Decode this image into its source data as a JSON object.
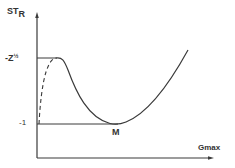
{
  "diagram": {
    "y_axis": {
      "label_main": "ST",
      "label_sub": "R"
    },
    "x_axis": {
      "label": "Gmax"
    },
    "ticks": {
      "upper": {
        "base": "-Z",
        "exp": "½"
      },
      "lower": "-1"
    },
    "point_label": "M",
    "colors": {
      "line": "#3a3a3a",
      "background": "#ffffff"
    },
    "curves": [
      {
        "name": "solid-curve",
        "style": "solid",
        "description": "plateau at -Z½, descends to minimum M at -1, then rises"
      },
      {
        "name": "dashed-curve",
        "style": "dashed",
        "description": "rises from -1 to -Z½ plateau"
      }
    ]
  }
}
